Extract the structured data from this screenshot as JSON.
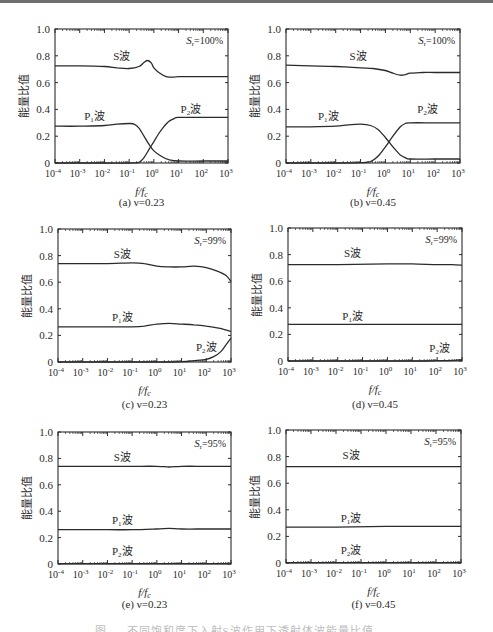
{
  "figure": {
    "caption_partial": "图 … 不同饱和度下入射S波作用下透射体波能量比值",
    "y_axis_label": "能量比值",
    "x_axis_label": "f/f",
    "x_axis_label_sub": "c"
  },
  "chart_data": [
    {
      "id": "a",
      "type": "line",
      "panel_label": "(a) ν=0.23",
      "annotation": "Sr=100%",
      "sat": "100%",
      "xscale": "log",
      "xlim": [
        0.0001,
        1000
      ],
      "ylim": [
        0,
        1.0
      ],
      "xticks": [
        "10^-4",
        "10^-3",
        "10^-2",
        "10^-1",
        "10^0",
        "10^1",
        "10^2",
        "10^3"
      ],
      "yticks": [
        "0",
        "0.2",
        "0.4",
        "0.6",
        "0.8",
        "1.0"
      ],
      "xlabel": "f/fc",
      "ylabel": "能量比值",
      "series": [
        {
          "name": "S波",
          "label_pos": [
            -1.3,
            0.77
          ],
          "x": [
            -4,
            -3,
            -2,
            -1.5,
            -1,
            -0.6,
            -0.4,
            -0.25,
            -0.1,
            0,
            0.2,
            0.5,
            0.8,
            1,
            2,
            3
          ],
          "y": [
            0.725,
            0.725,
            0.72,
            0.71,
            0.705,
            0.72,
            0.75,
            0.765,
            0.745,
            0.71,
            0.675,
            0.645,
            0.64,
            0.645,
            0.645,
            0.645
          ]
        },
        {
          "name": "P1波",
          "label_pos": [
            -2.4,
            0.32
          ],
          "x": [
            -4,
            -3,
            -2,
            -1.5,
            -1,
            -0.8,
            -0.6,
            -0.4,
            -0.2,
            0,
            0.3,
            0.6,
            1,
            2,
            3
          ],
          "y": [
            0.275,
            0.275,
            0.28,
            0.29,
            0.295,
            0.29,
            0.26,
            0.2,
            0.14,
            0.09,
            0.05,
            0.025,
            0.015,
            0.015,
            0.015
          ]
        },
        {
          "name": "P2波",
          "label_pos": [
            1.5,
            0.37
          ],
          "x": [
            -4,
            -2,
            -1,
            -0.6,
            -0.4,
            -0.2,
            0,
            0.2,
            0.4,
            0.6,
            0.8,
            1,
            2,
            3
          ],
          "y": [
            0,
            0,
            0,
            0.005,
            0.04,
            0.1,
            0.16,
            0.22,
            0.27,
            0.31,
            0.33,
            0.34,
            0.34,
            0.34
          ]
        }
      ]
    },
    {
      "id": "b",
      "type": "line",
      "panel_label": "(b) ν=0.45",
      "annotation": "Sr=100%",
      "sat": "100%",
      "xscale": "log",
      "xlim": [
        0.0001,
        1000
      ],
      "ylim": [
        0,
        1.0
      ],
      "xticks": [
        "10^-4",
        "10^-3",
        "10^-2",
        "10^-1",
        "10^0",
        "10^1",
        "10^2",
        "10^3"
      ],
      "yticks": [
        "0",
        "0.2",
        "0.4",
        "0.6",
        "0.8",
        "1.0"
      ],
      "xlabel": "f/fc",
      "ylabel": "能量比值",
      "series": [
        {
          "name": "S波",
          "label_pos": [
            -1.1,
            0.77
          ],
          "x": [
            -4,
            -3,
            -2,
            -1,
            -0.5,
            0,
            0.3,
            0.6,
            0.8,
            1,
            1.5,
            2,
            3
          ],
          "y": [
            0.73,
            0.725,
            0.72,
            0.71,
            0.705,
            0.69,
            0.67,
            0.655,
            0.66,
            0.67,
            0.675,
            0.675,
            0.675
          ]
        },
        {
          "name": "P1波",
          "label_pos": [
            -2.3,
            0.32
          ],
          "x": [
            -4,
            -3,
            -2,
            -1.5,
            -1,
            -0.6,
            -0.3,
            0,
            0.3,
            0.6,
            0.8,
            1,
            2,
            3
          ],
          "y": [
            0.27,
            0.27,
            0.275,
            0.285,
            0.29,
            0.28,
            0.25,
            0.19,
            0.12,
            0.06,
            0.04,
            0.03,
            0.03,
            0.03
          ]
        },
        {
          "name": "P2波",
          "label_pos": [
            1.7,
            0.37
          ],
          "x": [
            -4,
            -2,
            -1,
            -0.6,
            -0.3,
            0,
            0.3,
            0.6,
            0.8,
            1,
            2,
            3
          ],
          "y": [
            0,
            0,
            0.002,
            0.01,
            0.05,
            0.12,
            0.2,
            0.27,
            0.295,
            0.3,
            0.3,
            0.3
          ]
        }
      ]
    },
    {
      "id": "c",
      "type": "line",
      "panel_label": "(c) ν=0.23",
      "annotation": "Sr=99%",
      "sat": "99%",
      "xscale": "log",
      "xlim": [
        0.0001,
        1000
      ],
      "ylim": [
        0,
        1.0
      ],
      "xticks": [
        "10^-4",
        "10^-3",
        "10^-2",
        "10^-1",
        "10^0",
        "10^1",
        "10^2",
        "10^3"
      ],
      "yticks": [
        "0",
        "0.2",
        "0.4",
        "0.6",
        "0.8",
        "1.0"
      ],
      "xlabel": "f/fc",
      "ylabel": "能量比值",
      "series": [
        {
          "name": "S波",
          "label_pos": [
            -1.4,
            0.78
          ],
          "x": [
            -4,
            -3,
            -2,
            -1,
            -0.5,
            0,
            0.5,
            1,
            1.5,
            2,
            2.5,
            2.8,
            3
          ],
          "y": [
            0.74,
            0.74,
            0.74,
            0.745,
            0.74,
            0.72,
            0.715,
            0.715,
            0.72,
            0.71,
            0.68,
            0.65,
            0.605
          ]
        },
        {
          "name": "P1波",
          "label_pos": [
            -1.4,
            0.31
          ],
          "x": [
            -4,
            -3,
            -2,
            -1,
            -0.5,
            0,
            0.5,
            1,
            1.5,
            2,
            2.5,
            3
          ],
          "y": [
            0.265,
            0.265,
            0.265,
            0.265,
            0.27,
            0.285,
            0.29,
            0.285,
            0.28,
            0.27,
            0.255,
            0.23
          ]
        },
        {
          "name": "P2波",
          "label_pos": [
            2.0,
            0.08
          ],
          "x": [
            -4,
            0,
            1,
            1.5,
            2,
            2.3,
            2.6,
            2.8,
            3
          ],
          "y": [
            0,
            0,
            0.002,
            0.01,
            0.02,
            0.04,
            0.08,
            0.13,
            0.18
          ]
        }
      ]
    },
    {
      "id": "d",
      "type": "line",
      "panel_label": "(d) ν=0.45",
      "annotation": "Sr=99%",
      "sat": "99%",
      "xscale": "log",
      "xlim": [
        0.0001,
        1000
      ],
      "ylim": [
        0,
        1.0
      ],
      "xticks": [
        "10^-4",
        "10^-3",
        "10^-2",
        "10^-1",
        "10^0",
        "10^1",
        "10^2",
        "10^3"
      ],
      "yticks": [
        "0",
        "0.2",
        "0.4",
        "0.6",
        "0.8",
        "1.0"
      ],
      "xlabel": "f/fc",
      "ylabel": "能量比值",
      "series": [
        {
          "name": "S波",
          "label_pos": [
            -1.4,
            0.78
          ],
          "x": [
            -4,
            -2,
            0,
            1,
            2,
            2.6,
            3
          ],
          "y": [
            0.725,
            0.725,
            0.73,
            0.73,
            0.725,
            0.725,
            0.72
          ]
        },
        {
          "name": "P1波",
          "label_pos": [
            -1.4,
            0.31
          ],
          "x": [
            -4,
            -2,
            0,
            1,
            2,
            3
          ],
          "y": [
            0.275,
            0.275,
            0.275,
            0.275,
            0.275,
            0.275
          ]
        },
        {
          "name": "P2波",
          "label_pos": [
            2.1,
            0.07
          ],
          "x": [
            -4,
            1,
            2,
            2.7,
            3
          ],
          "y": [
            0,
            0,
            0.002,
            0.005,
            0.01
          ]
        }
      ]
    },
    {
      "id": "e",
      "type": "line",
      "panel_label": "(e) ν=0.23",
      "annotation": "Sr=95%",
      "sat": "95%",
      "xscale": "log",
      "xlim": [
        0.0001,
        1000
      ],
      "ylim": [
        0,
        1.0
      ],
      "xticks": [
        "10^-4",
        "10^-3",
        "10^-2",
        "10^-1",
        "10^0",
        "10^1",
        "10^2",
        "10^3"
      ],
      "yticks": [
        "0",
        "0.2",
        "0.4",
        "0.6",
        "0.8",
        "1.0"
      ],
      "xlabel": "f/fc",
      "ylabel": "能量比值",
      "series": [
        {
          "name": "S波",
          "label_pos": [
            -1.4,
            0.78
          ],
          "x": [
            -4,
            -2,
            -1,
            0,
            0.5,
            1,
            2,
            3
          ],
          "y": [
            0.74,
            0.74,
            0.74,
            0.74,
            0.735,
            0.74,
            0.74,
            0.74
          ]
        },
        {
          "name": "P1波",
          "label_pos": [
            -1.4,
            0.3
          ],
          "x": [
            -4,
            -2,
            -1,
            0,
            0.5,
            1,
            2,
            3
          ],
          "y": [
            0.26,
            0.26,
            0.26,
            0.265,
            0.27,
            0.265,
            0.265,
            0.265
          ]
        },
        {
          "name": "P2波",
          "label_pos": [
            -1.4,
            0.07
          ],
          "x": [
            -4,
            3
          ],
          "y": [
            0.003,
            0.003
          ]
        }
      ]
    },
    {
      "id": "f",
      "type": "line",
      "panel_label": "(f) ν=0.45",
      "annotation": "Sr=95%",
      "sat": "95%",
      "xscale": "log",
      "xlim": [
        0.0001,
        1000
      ],
      "ylim": [
        0,
        1.0
      ],
      "xticks": [
        "10^-4",
        "10^-3",
        "10^-2",
        "10^-1",
        "10^0",
        "10^1",
        "10^2",
        "10^3"
      ],
      "yticks": [
        "0",
        "0.2",
        "0.4",
        "0.6",
        "0.8",
        "1.0"
      ],
      "xlabel": "f/fc",
      "ylabel": "能量比值",
      "series": [
        {
          "name": "S波",
          "label_pos": [
            -1.4,
            0.78
          ],
          "x": [
            -4,
            -2,
            0,
            1,
            2,
            3
          ],
          "y": [
            0.725,
            0.725,
            0.725,
            0.725,
            0.725,
            0.725
          ]
        },
        {
          "name": "P1波",
          "label_pos": [
            -1.4,
            0.31
          ],
          "x": [
            -4,
            -2,
            0,
            1,
            2,
            3
          ],
          "y": [
            0.27,
            0.27,
            0.275,
            0.275,
            0.275,
            0.275
          ]
        },
        {
          "name": "P2波",
          "label_pos": [
            -1.4,
            0.07
          ],
          "x": [
            -4,
            3
          ],
          "y": [
            0.003,
            0.003
          ]
        }
      ]
    }
  ],
  "layout_panels": {
    "a": {
      "x0": 55,
      "x1": 228,
      "y0": 29,
      "y1": 163,
      "cap_y": 206
    },
    "b": {
      "x0": 286,
      "x1": 460,
      "y0": 29,
      "y1": 163,
      "cap_y": 206
    },
    "c": {
      "x0": 58,
      "x1": 231,
      "y0": 229,
      "y1": 362,
      "cap_y": 408
    },
    "d": {
      "x0": 288,
      "x1": 462,
      "y0": 228,
      "y1": 361,
      "cap_y": 408
    },
    "e": {
      "x0": 58,
      "x1": 231,
      "y0": 432,
      "y1": 564,
      "cap_y": 608
    },
    "f": {
      "x0": 286,
      "x1": 461,
      "y0": 430,
      "y1": 563,
      "cap_y": 608
    }
  }
}
